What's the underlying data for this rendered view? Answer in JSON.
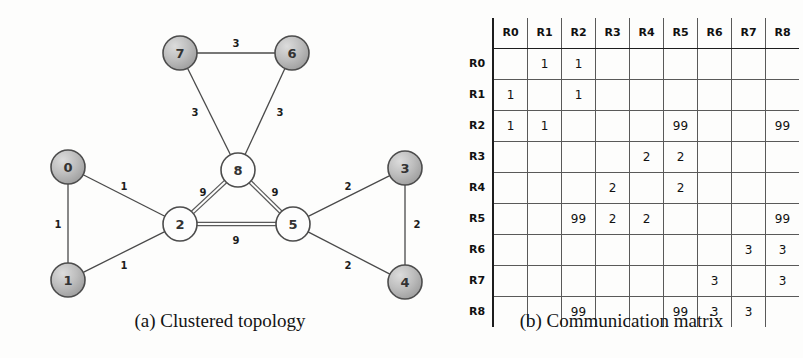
{
  "figure_a": {
    "caption": "(a) Clustered topology",
    "nodes": [
      {
        "id": "0",
        "label": "0",
        "cx": 68,
        "cy": 167,
        "r": 17,
        "style": "gray"
      },
      {
        "id": "1",
        "label": "1",
        "cx": 68,
        "cy": 280,
        "r": 17,
        "style": "gray"
      },
      {
        "id": "2",
        "label": "2",
        "cx": 180,
        "cy": 224,
        "r": 17,
        "style": "white"
      },
      {
        "id": "3",
        "label": "3",
        "cx": 405,
        "cy": 168,
        "r": 17,
        "style": "gray"
      },
      {
        "id": "4",
        "label": "4",
        "cx": 405,
        "cy": 282,
        "r": 17,
        "style": "gray"
      },
      {
        "id": "5",
        "label": "5",
        "cx": 293,
        "cy": 224,
        "r": 17,
        "style": "white"
      },
      {
        "id": "6",
        "label": "6",
        "cx": 292,
        "cy": 53,
        "r": 17,
        "style": "gray"
      },
      {
        "id": "7",
        "label": "7",
        "cx": 180,
        "cy": 53,
        "r": 17,
        "style": "gray"
      },
      {
        "id": "8",
        "label": "8",
        "cx": 238,
        "cy": 170,
        "r": 17,
        "style": "white"
      }
    ],
    "edges": [
      {
        "from": "7",
        "to": "6",
        "weight": "3",
        "lx": 236,
        "ly": 43,
        "thick": false
      },
      {
        "from": "7",
        "to": "8",
        "weight": "3",
        "lx": 195,
        "ly": 112,
        "thick": false
      },
      {
        "from": "6",
        "to": "8",
        "weight": "3",
        "lx": 280,
        "ly": 112,
        "thick": false
      },
      {
        "from": "0",
        "to": "1",
        "weight": "1",
        "lx": 58,
        "ly": 224,
        "thick": false
      },
      {
        "from": "0",
        "to": "2",
        "weight": "1",
        "lx": 124,
        "ly": 186,
        "thick": false
      },
      {
        "from": "1",
        "to": "2",
        "weight": "1",
        "lx": 124,
        "ly": 265,
        "thick": false
      },
      {
        "from": "3",
        "to": "4",
        "weight": "2",
        "lx": 417,
        "ly": 224,
        "thick": false
      },
      {
        "from": "5",
        "to": "3",
        "weight": "2",
        "lx": 348,
        "ly": 186,
        "thick": false
      },
      {
        "from": "5",
        "to": "4",
        "weight": "2",
        "lx": 348,
        "ly": 265,
        "thick": false
      },
      {
        "from": "2",
        "to": "8",
        "weight": "9",
        "lx": 203,
        "ly": 192,
        "thick": true
      },
      {
        "from": "5",
        "to": "8",
        "weight": "9",
        "lx": 275,
        "ly": 192,
        "thick": true
      },
      {
        "from": "2",
        "to": "5",
        "weight": "9",
        "lx": 236,
        "ly": 240,
        "thick": true
      }
    ]
  },
  "figure_b": {
    "caption": "(b) Communication matrix",
    "corner_label": "",
    "columns": [
      "R0",
      "R1",
      "R2",
      "R3",
      "R4",
      "R5",
      "R6",
      "R7",
      "R8"
    ],
    "rows": [
      {
        "label": "R0",
        "cells": [
          "",
          "1",
          "1",
          "",
          "",
          "",
          "",
          "",
          ""
        ]
      },
      {
        "label": "R1",
        "cells": [
          "1",
          "",
          "1",
          "",
          "",
          "",
          "",
          "",
          ""
        ]
      },
      {
        "label": "R2",
        "cells": [
          "1",
          "1",
          "",
          "",
          "",
          "99",
          "",
          "",
          "99"
        ]
      },
      {
        "label": "R3",
        "cells": [
          "",
          "",
          "",
          "",
          "2",
          "2",
          "",
          "",
          ""
        ]
      },
      {
        "label": "R4",
        "cells": [
          "",
          "",
          "",
          "2",
          "",
          "2",
          "",
          "",
          ""
        ]
      },
      {
        "label": "R5",
        "cells": [
          "",
          "",
          "99",
          "2",
          "2",
          "",
          "",
          "",
          "99"
        ]
      },
      {
        "label": "R6",
        "cells": [
          "",
          "",
          "",
          "",
          "",
          "",
          "",
          "3",
          "3"
        ]
      },
      {
        "label": "R7",
        "cells": [
          "",
          "",
          "",
          "",
          "",
          "",
          "3",
          "",
          "3"
        ]
      },
      {
        "label": "R8",
        "cells": [
          "",
          "",
          "99",
          "",
          "",
          "99",
          "3",
          "3",
          ""
        ]
      }
    ]
  },
  "colors": {
    "node_gray": "#b9b9b9",
    "node_white": "#fdfdfd",
    "stroke": "#4c4c4c",
    "text": "#141414",
    "grid": "#595959",
    "grid_major": "#1d1d1d"
  }
}
